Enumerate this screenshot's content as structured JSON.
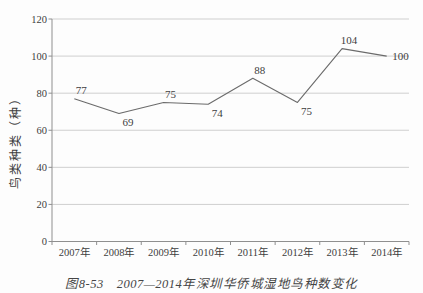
{
  "figure": {
    "caption_prefix": "图8-53",
    "caption_title": "2007—2014年深圳华侨城湿地鸟种数变化"
  },
  "chart_data": {
    "type": "line",
    "xlabel": "",
    "ylabel": "鸟类种类（种）",
    "categories": [
      "2007年",
      "2008年",
      "2009年",
      "2010年",
      "2011年",
      "2012年",
      "2013年",
      "2014年"
    ],
    "values": [
      77,
      69,
      75,
      74,
      88,
      75,
      104,
      100
    ],
    "data_labels": [
      77,
      69,
      75,
      74,
      88,
      75,
      104,
      100
    ],
    "label_positions": [
      "above",
      "below",
      "above",
      "below",
      "above",
      "below",
      "above",
      "right"
    ],
    "ylim": [
      0,
      120
    ],
    "yticks": [
      0,
      20,
      40,
      60,
      80,
      100,
      120
    ],
    "grid": "horizontal",
    "legend": "none",
    "markers": "none",
    "colors": {
      "line": "#6b6b6b",
      "grid": "#cfcfcf",
      "axis": "#8f8f8f",
      "text": "#3e3e3e"
    }
  }
}
